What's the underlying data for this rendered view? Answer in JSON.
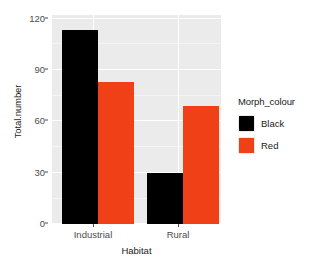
{
  "chart_data": {
    "type": "bar",
    "title": "",
    "xlabel": "Habitat",
    "ylabel": "Total.number",
    "categories": [
      "Industrial",
      "Rural"
    ],
    "series": [
      {
        "name": "Black",
        "color": "#000000",
        "values": [
          115,
          30
        ]
      },
      {
        "name": "Red",
        "color": "#ef4018",
        "values": [
          84,
          70
        ]
      }
    ],
    "legend_title": "Morph_colour",
    "legend_position": "right",
    "ylim": [
      0,
      124
    ],
    "y_ticks": [
      0,
      30,
      60,
      90,
      120
    ],
    "y_tick_labels": [
      "0",
      "30",
      "60",
      "90",
      "120"
    ],
    "grid": true,
    "panel_background": "#ebebeb",
    "grid_color": "#ffffff"
  },
  "axes": {
    "y_title": "Total.number",
    "x_title": "Habitat",
    "y_tick_labels": [
      "0",
      "30",
      "60",
      "90",
      "120"
    ],
    "x_tick_labels": [
      "Industrial",
      "Rural"
    ]
  },
  "legend": {
    "title": "Morph_colour",
    "items": [
      {
        "label": "Black",
        "color": "#000000"
      },
      {
        "label": "Red",
        "color": "#ef4018"
      }
    ]
  }
}
